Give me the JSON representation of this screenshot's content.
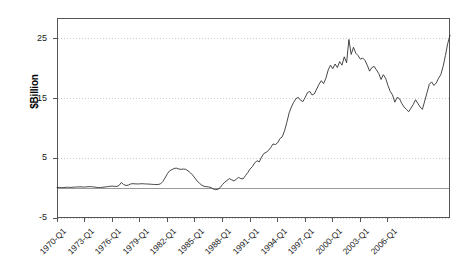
{
  "chart_data": {
    "type": "line",
    "title": "",
    "xlabel": "",
    "ylabel": "$Billion",
    "ylim": [
      -5,
      28.5
    ],
    "yticks": [
      -5,
      5,
      15,
      25
    ],
    "ytick_labels": [
      "-5",
      "5",
      "15",
      "25"
    ],
    "grid": "horizontal-dotted",
    "legend": "none",
    "zero_reference_line": 0,
    "x_start": "1970-Q1",
    "x_end": "2007-Q2",
    "x_frequency": "quarterly",
    "xtick_labels": [
      "1970-Q1",
      "1973-Q1",
      "1976-Q1",
      "1979-Q1",
      "1982-Q1",
      "1985-Q1",
      "1988-Q1",
      "1991-Q1",
      "1994-Q1",
      "1997-Q1",
      "2000-Q1",
      "2003-Q1",
      "2006-Q1"
    ],
    "series": [
      {
        "name": "series-1",
        "color": "#333333",
        "values": [
          0.1,
          0.12,
          0.08,
          0.1,
          0.15,
          0.14,
          0.12,
          0.16,
          0.18,
          0.2,
          0.22,
          0.2,
          0.18,
          0.22,
          0.25,
          0.24,
          0.2,
          0.15,
          0.1,
          0.12,
          0.15,
          0.2,
          0.25,
          0.3,
          0.35,
          0.3,
          0.28,
          0.45,
          0.95,
          0.6,
          0.45,
          0.5,
          0.7,
          0.75,
          0.72,
          0.7,
          0.72,
          0.74,
          0.72,
          0.7,
          0.68,
          0.65,
          0.62,
          0.6,
          0.62,
          0.7,
          1.1,
          1.7,
          2.4,
          2.9,
          3.1,
          3.3,
          3.35,
          3.2,
          3.15,
          3.2,
          3.15,
          2.9,
          2.6,
          2.2,
          1.7,
          1.2,
          0.8,
          0.5,
          0.3,
          0.25,
          0.2,
          0.1,
          -0.15,
          -0.25,
          -0.2,
          0.1,
          0.6,
          1.0,
          1.3,
          1.6,
          1.4,
          1.2,
          1.5,
          1.8,
          1.6,
          1.55,
          2.1,
          2.6,
          3.2,
          3.6,
          4.2,
          4.6,
          4.4,
          5.2,
          5.8,
          6.0,
          6.3,
          6.8,
          7.4,
          7.3,
          7.6,
          8.3,
          8.6,
          9.6,
          11.0,
          12.6,
          13.6,
          14.4,
          15.0,
          15.2,
          14.7,
          14.5,
          15.2,
          16.0,
          16.2,
          15.6,
          15.8,
          16.6,
          17.4,
          18.0,
          17.5,
          18.4,
          19.8,
          20.6,
          20.0,
          20.8,
          20.2,
          21.2,
          20.6,
          22.0,
          21.0,
          24.9,
          22.4,
          23.6,
          22.6,
          22.2,
          21.6,
          21.8,
          21.4,
          20.6,
          19.6,
          20.2,
          20.4,
          19.8,
          19.2,
          18.2,
          19.0,
          18.4,
          17.2,
          16.2,
          15.6,
          14.4,
          15.2,
          15.0,
          14.2,
          13.6,
          13.2,
          12.8,
          13.4,
          14.0,
          14.8,
          14.2,
          13.6,
          13.2,
          14.6,
          16.0,
          17.4,
          17.8,
          17.2,
          17.6,
          18.4,
          19.0,
          20.4,
          22.2,
          24.2,
          25.6
        ]
      }
    ]
  },
  "axes": {
    "ylabel": "$Billion"
  }
}
